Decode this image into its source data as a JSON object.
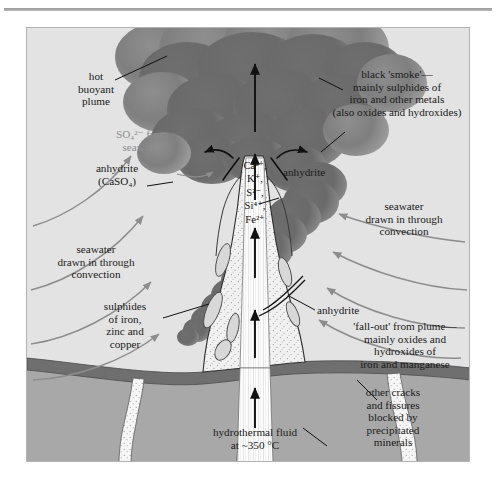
{
  "figure": {
    "title_rule": "horizontal-rule"
  },
  "labels": {
    "hot_plume": "hot\nbuoyant\nplume",
    "so4_seawater": "SO₄²⁻ from\nseawater",
    "anhydrite_caso4": "anhydrite\n(CaSO₄)",
    "anhydrite_right": "anhydrite",
    "anhydrite_mid": "anhydrite",
    "black_smoke": "black 'smoke'—\nmainly sulphides of\niron and other metals\n(also oxides and hydroxides)",
    "seawater_right": "seawater\ndrawn in through\nconvection",
    "seawater_left": "seawater\ndrawn in through\nconvection",
    "sulphides": "sulphides\nof iron,\nzinc and\ncopper",
    "fallout": "'fall-out' from plume—\nmainly oxides and\nhydroxides of\niron and manganese",
    "other_cracks": "other cracks\nand fissures\nblocked by\nprecipitated\nminerals",
    "hydrothermal_fluid": "hydrothermal fluid\nat ~350 °C"
  },
  "ions": {
    "list": [
      "Ca²⁺,",
      "K⁺,",
      "S²⁻,",
      "Si⁴⁺,",
      "Fe²⁺"
    ]
  },
  "colors": {
    "seawater_bg": "#e3e3e3",
    "basement_rock": "#a8a8a8",
    "crust_band": "#7b7b7b",
    "smoke_dark": "#6f6f6f",
    "smoke_light": "#8e8e8e",
    "mound_fill": "#f2f2f2",
    "conduit_white": "#fbfbfb",
    "arrow_grey": "#8d8d8d",
    "ink": "#1a1a1a",
    "panel_border": "#b2b2b2",
    "rule": "#9a9a9a"
  }
}
